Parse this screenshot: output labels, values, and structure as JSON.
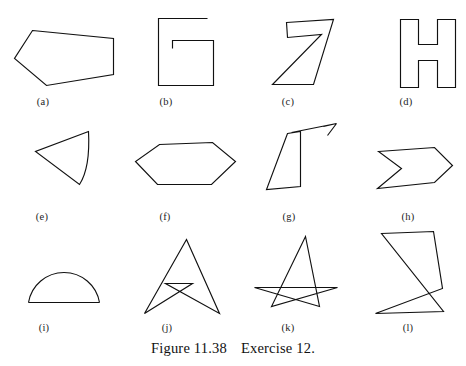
{
  "figure": {
    "caption_number": "Figure 11.38",
    "caption_text": "Exercise 12.",
    "background_color": "#ffffff",
    "ink_color": "#111111"
  },
  "shapes": [
    {
      "id": "a",
      "label": "(a)",
      "name": "convex-pentagon",
      "label_x": 43,
      "label_y": 96,
      "path": "M 32.5 30.5 L 113.5 38.5 L 113.5 74.5 L 46.5 85.5 L 14.5 58.5 Z"
    },
    {
      "id": "b",
      "label": "(b)",
      "name": "spiral-g-shape",
      "label_x": 166,
      "label_y": 96,
      "path": "M 207.5 18.5 L 158.5 18.5 L 158.5 85.5 L 213.5 85.5 L 213.5 40.5 L 172.5 40.5 L 172.5 48.5"
    },
    {
      "id": "c",
      "label": "(c)",
      "name": "digit-seven-shape",
      "label_x": 288,
      "label_y": 96,
      "path": "M 286.5 22.5 L 333.5 19.5 L 313.5 84.5 L 290.5 84.5 L 272.5 84.5 L 321.5 34.5 L 287.5 37.5 Z"
    },
    {
      "id": "d",
      "label": "(d)",
      "name": "letter-h-shape",
      "label_x": 406,
      "label_y": 96,
      "path": "M 400.5 19.5 L 418.5 19.5 L 418.5 44.5 L 437.5 44.5 L 437.5 19.5 L 455.5 19.5 L 455.5 87.5 L 437.5 87.5 L 437.5 60.5 L 418.5 60.5 L 418.5 87.5 L 400.5 87.5 Z"
    },
    {
      "id": "e",
      "label": "(e)",
      "name": "curved-side-triangle",
      "label_x": 42,
      "label_y": 211,
      "path": "M 88.5 131.5 L 35.5 151.5 L 79.5 184.5 C 88.5 170.5 89.5 150.5 88.5 131.5 Z"
    },
    {
      "id": "f",
      "label": "(f)",
      "name": "hexagon",
      "label_x": 165,
      "label_y": 211,
      "path": "M 159.5 144.5 L 212.5 142.5 L 235.5 161.5 L 211.5 184.5 L 157.5 184.5 L 135.5 161.5 Z"
    },
    {
      "id": "g",
      "label": "(g)",
      "name": "quadrilateral-with-ray",
      "label_x": 289,
      "label_y": 211,
      "path": "M 287.5 133.5 L 300.5 131.5 L 300.5 186.5 L 266.5 189.5 Z M 291.5 132.5 L 336.5 123.5 M 336.5 123.5 L 323.5 126.5 M 336.5 123.5 L 327.5 135.5"
    },
    {
      "id": "h",
      "label": "(h)",
      "name": "chevron-arrow-shape",
      "label_x": 408,
      "label_y": 211,
      "path": "M 378.5 151.5 L 434.5 147.5 L 452.5 165.5 L 434.5 182.5 L 377.5 188.5 L 401.5 168.5 Z"
    },
    {
      "id": "i",
      "label": "(i)",
      "name": "semicircle-dome",
      "label_x": 44,
      "label_y": 322,
      "path": "M 28.5 302.5 L 99.5 302.5 M 28.5 302.5 A 36 36 0 0 1 99.5 302.5"
    },
    {
      "id": "j",
      "label": "(j)",
      "name": "self-intersecting-arrowhead",
      "label_x": 167,
      "label_y": 322,
      "path": "M 186.5 239.5 L 219.5 313.5 L 165.5 283.5 L 192.5 283.5 L 144.5 313.5 Z"
    },
    {
      "id": "k",
      "label": "(k)",
      "name": "crossed-triangle-shape",
      "label_x": 288,
      "label_y": 322,
      "path": "M 305.5 236.5 L 319.5 306.5 L 254.5 287.5 L 337.5 287.5 L 271.5 306.5 Z"
    },
    {
      "id": "l",
      "label": "(l)",
      "name": "zigzag-crossed-polygon",
      "label_x": 408,
      "label_y": 322,
      "path": "M 381.5 233.5 L 433.5 231.5 L 442.5 288.5 L 375.5 313.5 L 443.5 311.5 Z"
    }
  ]
}
